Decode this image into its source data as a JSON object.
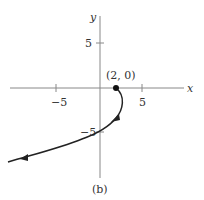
{
  "figure": {
    "caption": "(b)",
    "axes": {
      "x_label": "x",
      "y_label": "y",
      "x_ticks": [
        {
          "value": -5,
          "label": "−5"
        },
        {
          "value": 5,
          "label": "5"
        }
      ],
      "y_ticks": [
        {
          "value": 5,
          "label": "5"
        },
        {
          "value": -5,
          "label": "−5"
        }
      ]
    },
    "point": {
      "label": "(2, 0)",
      "x": 2,
      "y": 0
    },
    "curve": {
      "description": "Curve starting at (2,0), bending down through (0,-5) and continuing to lower left, with direction arrows",
      "start": [
        2,
        0
      ],
      "passes_through": [
        [
          0,
          -5
        ]
      ],
      "direction": "toward lower-left"
    },
    "colors": {
      "axis": "#888888",
      "curve": "#222222",
      "text": "#333333"
    }
  }
}
